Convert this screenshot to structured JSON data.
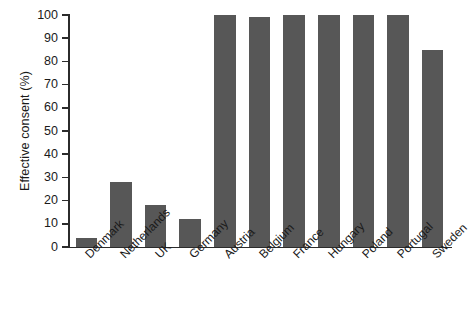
{
  "chart_data": {
    "type": "bar",
    "title": "",
    "subtitle": "",
    "xlabel": "",
    "ylabel": "Effective consent (%)",
    "ylim": [
      0,
      100
    ],
    "yticks": [
      0,
      10,
      20,
      30,
      40,
      50,
      60,
      70,
      80,
      90,
      100
    ],
    "grid": false,
    "legend": "none",
    "bar_color": "#575757",
    "axis_color": "#2b2b2b",
    "categories": [
      "Denmark",
      "Netherlands",
      "UK",
      "Germany",
      "Austria",
      "Belgium",
      "France",
      "Hungary",
      "Poland",
      "Portugal",
      "Sweden"
    ],
    "values": [
      4,
      28,
      18,
      12,
      100,
      99,
      100,
      100,
      100,
      100,
      85
    ]
  }
}
